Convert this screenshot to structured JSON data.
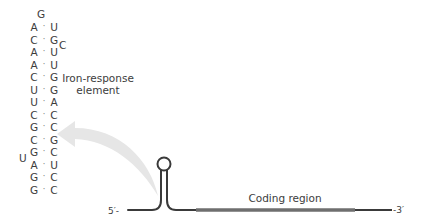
{
  "diagram": {
    "loop_top": "G",
    "stem_pairs": [
      {
        "left": "A",
        "right": "U"
      },
      {
        "left": "C",
        "right": "G"
      },
      {
        "left": "A",
        "right": "U"
      },
      {
        "left": "A",
        "right": "U"
      },
      {
        "left": "C",
        "right": "G"
      },
      {
        "left": "U",
        "right": "G"
      },
      {
        "left": "U",
        "right": "A"
      },
      {
        "left": "C",
        "right": "C"
      },
      {
        "left": "G",
        "right": "C"
      },
      {
        "left": "C",
        "right": "G"
      },
      {
        "left": "G",
        "right": "C"
      },
      {
        "left": "A",
        "right": "U"
      },
      {
        "left": "G",
        "right": "C"
      },
      {
        "left": "G",
        "right": "C"
      }
    ],
    "pair_separator": "·",
    "bulge_right": "C",
    "bulge_left": "U",
    "element_label_line1": "Iron-response",
    "element_label_line2": "element",
    "coding_region_label": "Coding region",
    "five_prime_label": "5′-",
    "three_prime_label": "-3′",
    "colors": {
      "text": "#3c3c3c",
      "mrna_line": "#3a3a3a",
      "coding_region": "#6f6f6f",
      "arrow": "#e4e4e4"
    }
  }
}
